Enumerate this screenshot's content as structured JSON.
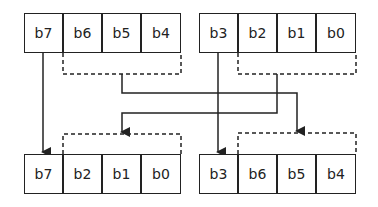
{
  "diagram": {
    "top_left": [
      "b7",
      "b6",
      "b5",
      "b4"
    ],
    "top_right": [
      "b3",
      "b2",
      "b1",
      "b0"
    ],
    "bottom_left": [
      "b7",
      "b2",
      "b1",
      "b0"
    ],
    "bottom_right": [
      "b3",
      "b6",
      "b5",
      "b4"
    ]
  }
}
